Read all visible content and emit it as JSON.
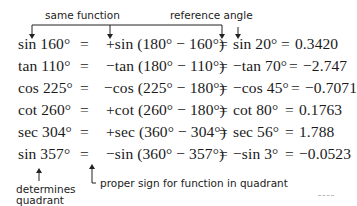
{
  "annotations": {
    "top_left": "same function",
    "top_right": "reference angle",
    "bottom_left_line1": "determines",
    "bottom_left_line2": "quadrant",
    "bottom_right": "proper sign for function in quadrant"
  },
  "rows": [
    {
      "lhs": "sin 160°",
      "eq1": "=",
      "expr": "+sin (180° − 160°)",
      "eq2": "=",
      "ref": "sin 20°",
      "eq3": "=",
      "value": "0.3420"
    },
    {
      "lhs": "tan 110°",
      "eq1": "=",
      "expr": "−tan (180° − 110°)",
      "eq2": "=",
      "ref": "−tan 70°",
      "eq3": "=",
      "value": "−2.747"
    },
    {
      "lhs": "cos 225°",
      "eq1": "=",
      "expr": "−cos (225° − 180°)",
      "eq2": "=",
      "ref": "−cos 45°",
      "eq3": "=",
      "value": "−0.7071"
    },
    {
      "lhs": "cot 260°",
      "eq1": "=",
      "expr": "+cot (260° − 180°)",
      "eq2": "=",
      "ref": "cot 80°",
      "eq3": "=",
      "value": "0.1763"
    },
    {
      "lhs": "sec 304°",
      "eq1": "=",
      "expr": "+sec (360° − 304°)",
      "eq2": "=",
      "ref": "sec 56°",
      "eq3": "=",
      "value": "1.788"
    },
    {
      "lhs": "sin 357°",
      "eq1": "=",
      "expr": "−sin (360° − 357°)",
      "eq2": "=",
      "ref": "−sin 3°",
      "eq3": "=",
      "value": "−0.0523"
    }
  ]
}
